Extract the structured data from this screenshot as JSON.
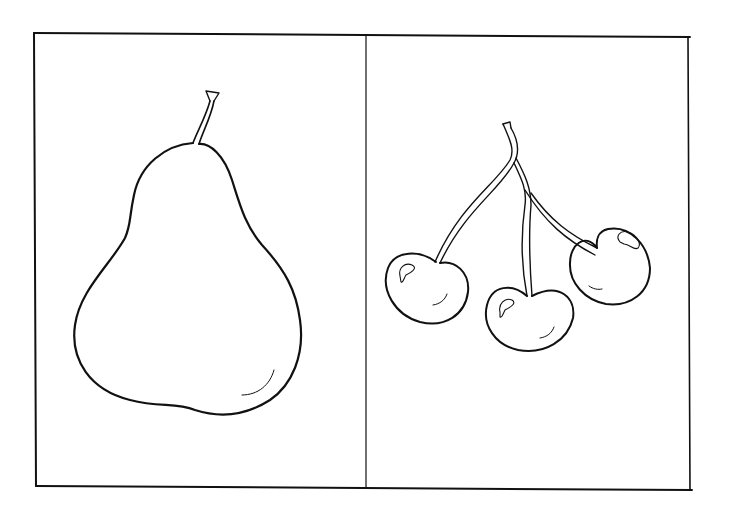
{
  "page": {
    "type": "coloring-page",
    "background": "#ffffff",
    "line_color": "#111111"
  },
  "panels": [
    {
      "id": "left",
      "subject": "pear",
      "icon": "pear-icon"
    },
    {
      "id": "right",
      "subject": "cherries",
      "icon": "cherries-icon",
      "count": 3
    }
  ]
}
